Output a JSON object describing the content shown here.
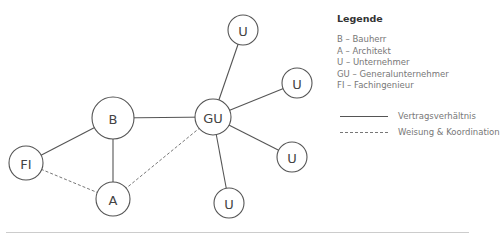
{
  "diagram": {
    "nodes": [
      {
        "id": "B",
        "label": "B"
      },
      {
        "id": "A",
        "label": "A"
      },
      {
        "id": "FI",
        "label": "FI"
      },
      {
        "id": "GU",
        "label": "GU"
      },
      {
        "id": "U1",
        "label": "U"
      },
      {
        "id": "U2",
        "label": "U"
      },
      {
        "id": "U3",
        "label": "U"
      },
      {
        "id": "U4",
        "label": "U"
      }
    ],
    "edges": [
      {
        "from": "B",
        "to": "GU",
        "type": "Vertragsverhältnis"
      },
      {
        "from": "B",
        "to": "FI",
        "type": "Vertragsverhältnis"
      },
      {
        "from": "B",
        "to": "A",
        "type": "Vertragsverhältnis"
      },
      {
        "from": "GU",
        "to": "U1",
        "type": "Vertragsverhältnis"
      },
      {
        "from": "GU",
        "to": "U2",
        "type": "Vertragsverhältnis"
      },
      {
        "from": "GU",
        "to": "U3",
        "type": "Vertragsverhältnis"
      },
      {
        "from": "GU",
        "to": "U4",
        "type": "Vertragsverhältnis"
      },
      {
        "from": "A",
        "to": "FI",
        "type": "Weisung & Koordination"
      },
      {
        "from": "A",
        "to": "GU",
        "type": "Weisung & Koordination"
      }
    ]
  },
  "legend": {
    "title": "Legende",
    "items": [
      "B – Bauherr",
      "A – Architekt",
      "U – Unternehmer",
      "GU – Generalunternehmer",
      "FI – Fachingenieur"
    ],
    "line_types": [
      {
        "style": "solid",
        "label": "Vertragsverhältnis"
      },
      {
        "style": "dashed",
        "label": "Weisung & Koordination"
      }
    ]
  }
}
